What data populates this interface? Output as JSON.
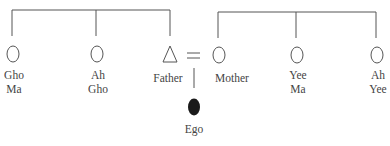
{
  "diagram": {
    "type": "kinship-chart",
    "left_sibling_group": [
      {
        "id": "gho-ma",
        "label_lines": [
          "Gho",
          "Ma"
        ],
        "symbol": "circle",
        "sex": "female"
      },
      {
        "id": "ah-gho",
        "label_lines": [
          "Ah",
          "Gho"
        ],
        "symbol": "circle",
        "sex": "female"
      },
      {
        "id": "father",
        "label_lines": [
          "Father"
        ],
        "symbol": "triangle",
        "sex": "male"
      }
    ],
    "right_sibling_group": [
      {
        "id": "mother",
        "label_lines": [
          "Mother"
        ],
        "symbol": "circle",
        "sex": "female"
      },
      {
        "id": "yee-ma",
        "label_lines": [
          "Yee",
          "Ma"
        ],
        "symbol": "circle",
        "sex": "female"
      },
      {
        "id": "ah-yee",
        "label_lines": [
          "Ah",
          "Yee"
        ],
        "symbol": "circle",
        "sex": "female"
      }
    ],
    "marriage": {
      "between": [
        "father",
        "mother"
      ],
      "symbol": "="
    },
    "child": {
      "id": "ego",
      "label_lines": [
        "Ego"
      ],
      "symbol": "filled-ellipse"
    },
    "colors": {
      "line": "#555555",
      "ego_fill": "#1a1a1a"
    }
  }
}
